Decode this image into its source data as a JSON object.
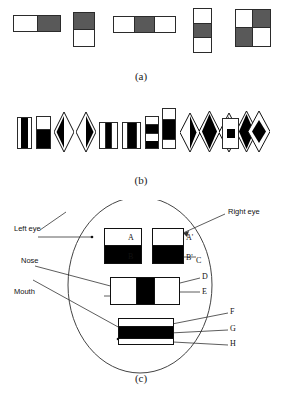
{
  "figure": {
    "colors": {
      "dark_fill": "#595959",
      "black_fill": "#000000",
      "light_fill": "#ffffff",
      "stroke": "#2b2b2b",
      "line": "#333333"
    }
  },
  "panel_a": {
    "caption": "(a)",
    "features": [
      {
        "name": "two-rectangle-horizontal",
        "orientation": "horizontal",
        "cells": [
          "light",
          "dark"
        ]
      },
      {
        "name": "two-rectangle-vertical",
        "orientation": "vertical",
        "cells": [
          "dark",
          "light"
        ]
      },
      {
        "name": "three-rectangle-horizontal",
        "orientation": "horizontal",
        "cells": [
          "light",
          "dark",
          "light"
        ]
      },
      {
        "name": "three-rectangle-vertical",
        "orientation": "vertical",
        "cells": [
          "light",
          "dark",
          "light"
        ]
      },
      {
        "name": "four-rectangle-checkerboard",
        "orientation": "quad",
        "cells": [
          "light",
          "dark",
          "dark",
          "light"
        ]
      }
    ]
  },
  "panel_b": {
    "caption": "(b)",
    "features": [
      {
        "name": "upright-center-black-stripe",
        "shape": "rect",
        "orientation": "horizontal",
        "cells": [
          "light",
          "black",
          "light"
        ]
      },
      {
        "name": "upright-top-white-bottom-black",
        "shape": "rect",
        "orientation": "vertical",
        "cells": [
          "light",
          "black"
        ]
      },
      {
        "name": "diamond-left-black",
        "shape": "diamond",
        "fill": "left-black"
      },
      {
        "name": "diamond-right-black",
        "shape": "diamond",
        "fill": "right-black"
      },
      {
        "name": "upright-three-vertical-bands",
        "shape": "rect",
        "orientation": "horizontal",
        "cells": [
          "light",
          "black",
          "light"
        ]
      },
      {
        "name": "upright-two-bands-black-right",
        "shape": "rect",
        "orientation": "horizontal",
        "cells": [
          "light",
          "black"
        ]
      },
      {
        "name": "upright-stacked-four",
        "shape": "rect",
        "orientation": "vertical",
        "cells": [
          "light",
          "black",
          "light",
          "black"
        ]
      },
      {
        "name": "upright-stacked-tall",
        "shape": "rect",
        "orientation": "vertical",
        "cells": [
          "light",
          "black",
          "light"
        ]
      },
      {
        "name": "diamond-lower-black",
        "shape": "diamond",
        "fill": "bottom-black"
      },
      {
        "name": "diamond-solid-black",
        "shape": "diamond",
        "fill": "solid-black"
      },
      {
        "name": "diamond-upper-black",
        "shape": "diamond",
        "fill": "top-black"
      },
      {
        "name": "diamond-solid-black-2",
        "shape": "diamond",
        "fill": "solid-black"
      },
      {
        "name": "rect-with-black-core",
        "shape": "rect",
        "orientation": "center",
        "cells": [
          "light",
          "black",
          "light"
        ]
      },
      {
        "name": "diamond-small-black-core",
        "shape": "diamond",
        "fill": "small-core"
      }
    ]
  },
  "panel_c": {
    "caption": "(c)",
    "labels": {
      "left_eye": "Left eye",
      "right_eye": "Right eye",
      "nose": "Nose",
      "mouth": "Mouth"
    },
    "markers": [
      {
        "id": "A",
        "text": "A"
      },
      {
        "id": "B",
        "text": "B"
      },
      {
        "id": "A2",
        "text": "A'"
      },
      {
        "id": "B2",
        "text": "B'"
      },
      {
        "id": "C",
        "text": "C"
      },
      {
        "id": "D",
        "text": "D"
      },
      {
        "id": "E",
        "text": "E"
      },
      {
        "id": "F",
        "text": "F"
      },
      {
        "id": "G",
        "text": "G"
      },
      {
        "id": "H",
        "text": "H"
      }
    ],
    "regions": [
      {
        "name": "left-eye-feature",
        "cells": [
          "light",
          "black"
        ],
        "orientation": "vertical"
      },
      {
        "name": "right-eye-feature",
        "cells": [
          "light",
          "black"
        ],
        "orientation": "vertical"
      },
      {
        "name": "nose-feature",
        "cells": [
          "light",
          "black",
          "light"
        ],
        "orientation": "horizontal"
      },
      {
        "name": "mouth-feature",
        "cells": [
          "light",
          "black",
          "light"
        ],
        "orientation": "vertical"
      }
    ]
  }
}
